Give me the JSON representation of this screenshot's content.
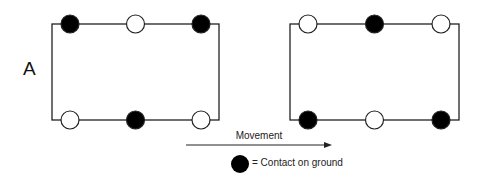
{
  "diagram": {
    "panel_label": "A",
    "movement_label": "Movement",
    "legend_text": "= Contact on ground",
    "colors": {
      "stroke": "#222222",
      "filled": "#000000",
      "empty": "#ffffff"
    },
    "frames": [
      {
        "name": "frame-1",
        "rect": {
          "x": 52,
          "y": 24,
          "w": 167,
          "h": 96
        },
        "top": [
          "contact",
          "air",
          "contact"
        ],
        "bottom": [
          "air",
          "contact",
          "air"
        ]
      },
      {
        "name": "frame-2",
        "rect": {
          "x": 290,
          "y": 24,
          "w": 169,
          "h": 96
        },
        "top": [
          "air",
          "contact",
          "air"
        ],
        "bottom": [
          "contact",
          "air",
          "contact"
        ]
      }
    ],
    "arrow": {
      "x1": 186,
      "x2": 332,
      "y": 145
    },
    "legend_circle": {
      "cx": 240,
      "cy": 164,
      "r": 9
    }
  }
}
